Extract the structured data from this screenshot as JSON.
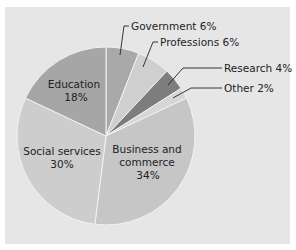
{
  "title_partial": "",
  "chart_data": {
    "type": "pie",
    "title": "",
    "start_angle_deg": 0,
    "direction": "clockwise",
    "slices": [
      {
        "label": "Government",
        "value": 6,
        "label_text": "Government 6%",
        "color": "#a9a9a9"
      },
      {
        "label": "Professions",
        "value": 6,
        "label_text": "Professions 6%",
        "color": "#cfcfcf"
      },
      {
        "label": "Research",
        "value": 4,
        "label_text": "Research 4%",
        "color": "#7d7d7d"
      },
      {
        "label": "Other",
        "value": 2,
        "label_text": "Other 2%",
        "color": "#d6d6d6"
      },
      {
        "label": "Business and commerce",
        "value": 34,
        "label_text": "Business and commerce 34%",
        "color": "#c6c6c6"
      },
      {
        "label": "Social services",
        "value": 30,
        "label_text": "Social services 30%",
        "color": "#cdcdcd"
      },
      {
        "label": "Education",
        "value": 18,
        "label_text": "Education 18%",
        "color": "#a6a6a6"
      }
    ],
    "units": "%"
  },
  "labels": {
    "government": "Government 6%",
    "professions": "Professions 6%",
    "research": "Research 4%",
    "other": "Other 2%",
    "business_line1": "Business and",
    "business_line2": "commerce",
    "business_line3": "34%",
    "social_line1": "Social services",
    "social_line2": "30%",
    "education_line1": "Education",
    "education_line2": "18%"
  }
}
